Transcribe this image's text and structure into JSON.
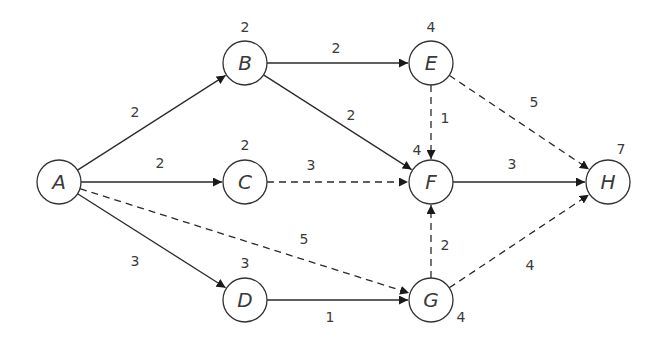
{
  "diagram": {
    "type": "activity-network",
    "colors": {
      "stroke": "#2a2a2a",
      "text": "#3a3a3a",
      "background": "#ffffff"
    },
    "node_radius": 22,
    "nodes": [
      {
        "id": "A",
        "label": "A",
        "x": 59,
        "y": 182,
        "time": "",
        "tx": 0,
        "ty": 0
      },
      {
        "id": "B",
        "label": "B",
        "x": 245,
        "y": 63,
        "time": "2",
        "tx": 245,
        "ty": 32
      },
      {
        "id": "C",
        "label": "C",
        "x": 245,
        "y": 182,
        "time": "2",
        "tx": 245,
        "ty": 150
      },
      {
        "id": "D",
        "label": "D",
        "x": 245,
        "y": 300,
        "time": "3",
        "tx": 245,
        "ty": 268
      },
      {
        "id": "E",
        "label": "E",
        "x": 431,
        "y": 63,
        "time": "4",
        "tx": 431,
        "ty": 32
      },
      {
        "id": "F",
        "label": "F",
        "x": 431,
        "y": 182,
        "time": "4",
        "tx": 417,
        "ty": 155
      },
      {
        "id": "G",
        "label": "G",
        "x": 431,
        "y": 300,
        "time": "4",
        "tx": 461,
        "ty": 322
      },
      {
        "id": "H",
        "label": "H",
        "x": 608,
        "y": 182,
        "time": "7",
        "tx": 621,
        "ty": 154
      }
    ],
    "edges": [
      {
        "from": "A",
        "to": "B",
        "weight": "2",
        "style": "solid",
        "lx": 135,
        "ly": 117
      },
      {
        "from": "A",
        "to": "C",
        "weight": "2",
        "style": "solid",
        "lx": 160,
        "ly": 168
      },
      {
        "from": "A",
        "to": "D",
        "weight": "3",
        "style": "solid",
        "lx": 135,
        "ly": 266
      },
      {
        "from": "A",
        "to": "G",
        "weight": "5",
        "style": "dashed",
        "lx": 304,
        "ly": 244
      },
      {
        "from": "B",
        "to": "E",
        "weight": "2",
        "style": "solid",
        "lx": 336,
        "ly": 53
      },
      {
        "from": "B",
        "to": "F",
        "weight": "2",
        "style": "solid",
        "lx": 351,
        "ly": 120
      },
      {
        "from": "C",
        "to": "F",
        "weight": "3",
        "style": "dashed",
        "lx": 311,
        "ly": 170
      },
      {
        "from": "D",
        "to": "G",
        "weight": "1",
        "style": "solid",
        "lx": 330,
        "ly": 322
      },
      {
        "from": "E",
        "to": "F",
        "weight": "1",
        "style": "dashed",
        "lx": 445,
        "ly": 123
      },
      {
        "from": "E",
        "to": "H",
        "weight": "5",
        "style": "dashed",
        "lx": 534,
        "ly": 107
      },
      {
        "from": "F",
        "to": "H",
        "weight": "3",
        "style": "solid",
        "lx": 512,
        "ly": 169
      },
      {
        "from": "G",
        "to": "F",
        "weight": "2",
        "style": "dashed",
        "lx": 445,
        "ly": 250
      },
      {
        "from": "G",
        "to": "H",
        "weight": "4",
        "style": "dashed",
        "lx": 530,
        "ly": 270
      }
    ]
  }
}
